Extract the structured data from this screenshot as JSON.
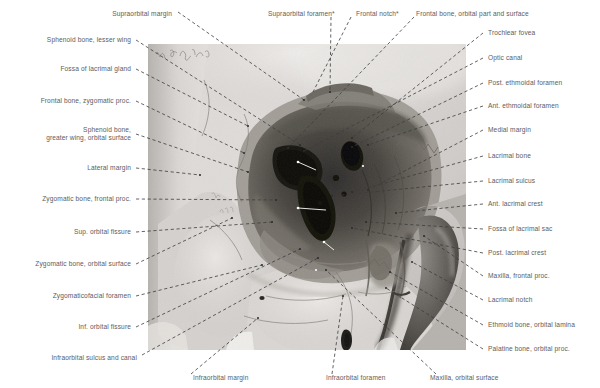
{
  "figure": {
    "type": "anatomical-photograph",
    "modality": "grayscale photograph of dry skull specimen",
    "handwritten_annotation": "illegible cursive note, upper-left of photograph",
    "photo_frame": {
      "x": 148,
      "y": 44,
      "width": 318,
      "height": 306
    },
    "leader_line_style": "dashed",
    "leader_line_color": "#3c3c3c",
    "label_color": "#5d5d5d",
    "background_color": "#ffffff"
  },
  "labels_top": [
    {
      "id": "supraorbital-margin",
      "text": "Supraorbital margin",
      "tx": 172,
      "ty": 14,
      "anchor": "end",
      "px": 304,
      "py": 100
    },
    {
      "id": "supraorbital-foramen",
      "text": "Supraorbital foramen*",
      "tx": 268,
      "ty": 14,
      "anchor": "start",
      "px": 330,
      "py": 92
    },
    {
      "id": "frontal-notch",
      "text": "Frontal notch*",
      "tx": 350,
      "ty": 14,
      "anchor": "start",
      "px": 313,
      "py": 92
    },
    {
      "id": "frontal-bone-orbital-part",
      "text": "Frontal bone, orbital part and surface",
      "tx": 416,
      "ty": 14,
      "anchor": "start",
      "px": 288,
      "py": 148
    }
  ],
  "labels_left": [
    {
      "id": "sphenoid-lesser-wing",
      "text": "Sphenoid bone, lesser wing",
      "tx": 131,
      "ty": 40,
      "px": 300,
      "py": 145
    },
    {
      "id": "fossa-lacrimal-gland",
      "text": "Fossa of lacrimal gland",
      "tx": 131,
      "ty": 69,
      "px": 248,
      "py": 126
    },
    {
      "id": "frontal-bone-zygomatic-proc",
      "text": "Frontal bone, zygomatic proc.",
      "tx": 131,
      "ty": 101,
      "px": 244,
      "py": 153
    },
    {
      "id": "sphenoid-greater-wing",
      "text": "Sphenoid bone,\ngreater wing, orbital surface",
      "tx": 131,
      "ty": 134,
      "px": 248,
      "py": 172,
      "lines": 2
    },
    {
      "id": "lateral-margin",
      "text": "Lateral margin",
      "tx": 131,
      "ty": 168,
      "px": 200,
      "py": 175
    },
    {
      "id": "zygomatic-bone-frontal-proc",
      "text": "Zygomatic bone, frontal proc.",
      "tx": 131,
      "ty": 199,
      "px": 276,
      "py": 200
    },
    {
      "id": "sup-orbital-fissure",
      "text": "Sup. orbital fissure",
      "tx": 131,
      "ty": 232,
      "px": 272,
      "py": 222
    },
    {
      "id": "zygomatic-bone-orbital-surface",
      "text": "Zygomatic bone, orbital surface",
      "tx": 131,
      "ty": 264,
      "px": 232,
      "py": 218
    },
    {
      "id": "zygomaticofacial-foramen",
      "text": "Zygomaticofacial foramen",
      "tx": 131,
      "ty": 296,
      "px": 262,
      "py": 265
    },
    {
      "id": "inf-orbital-fissure",
      "text": "Inf. orbital fissure",
      "tx": 131,
      "ty": 327,
      "px": 300,
      "py": 249
    }
  ],
  "labels_right": [
    {
      "id": "trochlear-fovea",
      "text": "Trochlear fovea",
      "tx": 488,
      "ty": 33,
      "px": 352,
      "py": 138
    },
    {
      "id": "optic-canal",
      "text": "Optic canal",
      "tx": 488,
      "ty": 58,
      "px": 304,
      "py": 151
    },
    {
      "id": "post-ethmoidal-foramen",
      "text": "Post. ethmoidal foramen",
      "tx": 488,
      "ty": 83,
      "px": 352,
      "py": 147
    },
    {
      "id": "ant-ethmoidal-foramen",
      "text": "Ant. ethmoidal foramen",
      "tx": 488,
      "ty": 106,
      "px": 368,
      "py": 145
    },
    {
      "id": "medial-margin",
      "text": "Medial margin",
      "tx": 488,
      "ty": 130,
      "px": 368,
      "py": 190
    },
    {
      "id": "lacrimal-bone",
      "text": "Lacrimal bone",
      "tx": 488,
      "ty": 156,
      "px": 352,
      "py": 192
    },
    {
      "id": "lacrimal-sulcus",
      "text": "Lacrimal sulcus",
      "tx": 488,
      "ty": 181,
      "px": 332,
      "py": 196
    },
    {
      "id": "ant-lacrimal-crest",
      "text": "Ant. lacrimal crest",
      "tx": 488,
      "ty": 204,
      "px": 396,
      "py": 213
    },
    {
      "id": "fossa-lacrimal-sac",
      "text": "Fossa of lacrimal sac",
      "tx": 488,
      "ty": 229,
      "px": 366,
      "py": 222
    },
    {
      "id": "post-lacrimal-crest",
      "text": "Post. lacrimal crest",
      "tx": 488,
      "ty": 253,
      "px": 352,
      "py": 228
    },
    {
      "id": "maxilla-frontal-proc",
      "text": "Maxilla, frontal proc.",
      "tx": 488,
      "ty": 276,
      "px": 424,
      "py": 236
    },
    {
      "id": "lacrimal-notch",
      "text": "Lacrimal notch",
      "tx": 488,
      "ty": 300,
      "px": 412,
      "py": 262
    },
    {
      "id": "ethmoid-bone-orbital-lamina",
      "text": "Ethmoid bone, orbital lamina",
      "tx": 488,
      "ty": 325,
      "px": 390,
      "py": 272
    },
    {
      "id": "palatine-bone-orbital-proc",
      "text": "Palatine bone, orbital proc.",
      "tx": 488,
      "ty": 349,
      "px": 386,
      "py": 288
    }
  ],
  "labels_bottom": [
    {
      "id": "infraorbital-sulcus-and-canal",
      "text": "Infraorbital sulcus and canal",
      "tx": 137,
      "ty": 358,
      "anchor": "end",
      "px": 318,
      "py": 258
    },
    {
      "id": "infraorbital-margin",
      "text": "Infraorbital margin",
      "tx": 193,
      "ty": 378,
      "anchor": "start",
      "px": 258,
      "py": 318
    },
    {
      "id": "infraorbital-foramen",
      "text": "Infraorbital foramen",
      "tx": 326,
      "ty": 378,
      "anchor": "start",
      "px": 343,
      "py": 296
    },
    {
      "id": "maxilla-orbital-surface",
      "text": "Maxilla, orbital surface",
      "tx": 430,
      "ty": 378,
      "anchor": "start",
      "px": 326,
      "py": 270
    }
  ]
}
